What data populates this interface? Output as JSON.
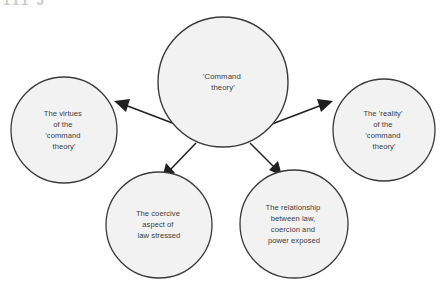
{
  "figure": {
    "type": "concept-map",
    "layout": "radial hub and spoke",
    "background_color": "#ffffff",
    "node_fill_color": "#f2f2f2",
    "node_stroke_color": "#3a3a3a",
    "text_color": "#3d3d3d",
    "arrow_color": "#1f1f1f",
    "cropped_header_artifact": "111 J"
  },
  "nodes": {
    "hub": {
      "id": "command-theory",
      "lines": [
        "'Command",
        "theory'"
      ],
      "text": "'Command theory'",
      "cx": 223,
      "cy": 82,
      "r": 65
    },
    "satellites": [
      {
        "id": "virtues",
        "lines": [
          "The virtues",
          "of the",
          "'command",
          "theory'"
        ],
        "text": "The virtues of the 'command theory'",
        "cx": 64,
        "cy": 130,
        "r": 53,
        "direction": "left"
      },
      {
        "id": "coercive-aspect",
        "lines": [
          "The coercive",
          "aspect of",
          "law stressed"
        ],
        "text": "The coercive aspect of law stressed",
        "cx": 159,
        "cy": 225,
        "r": 53,
        "direction": "bottom-left"
      },
      {
        "id": "relationship-law-coercion-power",
        "lines": [
          "The relationship",
          "between law,",
          "coercion and",
          "power exposed"
        ],
        "text": "The relationship between law, coercion and power exposed",
        "cx": 294,
        "cy": 224,
        "r": 54,
        "direction": "bottom-right"
      },
      {
        "id": "reality",
        "lines": [
          "The 'reality'",
          "of the",
          "'command",
          "theory'"
        ],
        "text": "The 'reality' of the 'command theory'",
        "cx": 384,
        "cy": 130,
        "r": 51,
        "direction": "right"
      }
    ]
  },
  "edges": [
    {
      "id": "hub-to-virtues",
      "from": "command-theory",
      "to": "virtues",
      "style": "solid-arrow"
    },
    {
      "id": "hub-to-coercive-aspect",
      "from": "command-theory",
      "to": "coercive-aspect",
      "style": "solid-arrow"
    },
    {
      "id": "hub-to-relationship",
      "from": "command-theory",
      "to": "relationship-law-coercion-power",
      "style": "solid-arrow"
    },
    {
      "id": "hub-to-reality",
      "from": "command-theory",
      "to": "reality",
      "style": "solid-arrow"
    }
  ]
}
